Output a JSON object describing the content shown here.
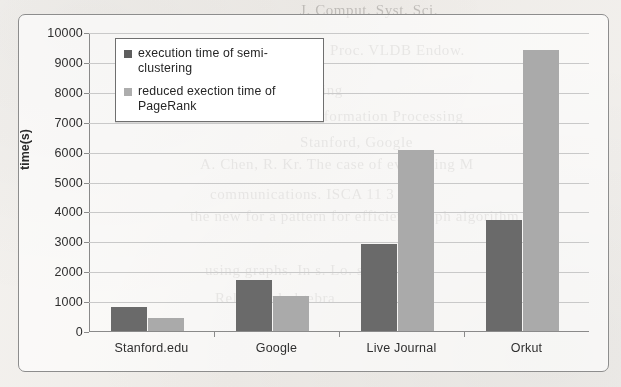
{
  "chart_data": {
    "type": "bar",
    "title": "",
    "xlabel": "",
    "ylabel": "time(s)",
    "ylim": [
      0,
      10000
    ],
    "ytick_step": 1000,
    "yticks": [
      "10000",
      "9000",
      "8000",
      "7000",
      "6000",
      "5000",
      "4000",
      "3000",
      "2000",
      "1000",
      "0"
    ],
    "grid": true,
    "legend_position": "top-left-inside",
    "categories": [
      "Stanford.edu",
      "Google",
      "Live Journal",
      "Orkut"
    ],
    "series": [
      {
        "name": "execution time of semi-clustering",
        "color": "#6a6a6a",
        "values": [
          800,
          1700,
          2900,
          3700
        ]
      },
      {
        "name": "reduced exection time of PageRank",
        "color": "#aaaaaa",
        "values": [
          430,
          1170,
          6050,
          9400
        ]
      }
    ]
  },
  "legend": {
    "entries": [
      {
        "label": "execution time of semi-clustering",
        "swatch": "dark"
      },
      {
        "label": "reduced exection time of PageRank",
        "swatch": "light"
      }
    ]
  },
  "axis": {
    "y_title": "time(s)"
  },
  "page_background": {
    "bleed_text": [
      "J. Comput. Syst. Sci.",
      "Proc. VLDB Endow.",
      "Data Mining",
      "Information Processing",
      "Stanford, Google",
      "A. Chen, R.  Kr. The case of evaluating M",
      "communications. ISCA 11 3 7 9",
      "the new for a pattern for efficient graph algorithm",
      "using graphs. In  s. Lo. stm.",
      "Relational algebra"
    ]
  },
  "colors": {
    "series_dark": "#6a6a6a",
    "series_light": "#aaaaaa",
    "gridline": "#c9c9c9",
    "axis": "#8a8a8a",
    "frame": "#8d8d8d",
    "paper": "#f1efec"
  }
}
